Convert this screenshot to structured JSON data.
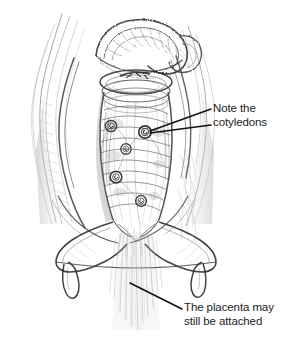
{
  "illustration": {
    "title": "Birth canal with emerging umbilical cord showing cotyledons",
    "medium": "pencil sketch",
    "background_color": "#ffffff",
    "ink_color": "#1c1c1c",
    "pencil_color": "#6e6e70",
    "parts": [
      {
        "name": "cord-loop",
        "description": "looped umbilical cord at top"
      },
      {
        "name": "textured-cord-body",
        "description": "vertical ribbed tubular cord body"
      },
      {
        "name": "cotyledon",
        "description": "small spiral ring structures on cord body",
        "count": 5
      },
      {
        "name": "vulva-flare",
        "description": "flared wing shape with two tapered downward projections"
      },
      {
        "name": "trailing-membranes",
        "description": "fine vertical streaming lines below opening"
      },
      {
        "name": "canal-wall-left",
        "description": "flowing pencil strokes forming left wall"
      },
      {
        "name": "canal-wall-right",
        "description": "flowing pencil strokes forming right wall"
      }
    ]
  },
  "annotations": [
    {
      "id": "cotyledons",
      "line1": "Note the",
      "line2": "cotyledons",
      "leader_count": 2,
      "points_to": "cotyledon"
    },
    {
      "id": "placenta",
      "line1": "The placenta may",
      "line2": "still be attached",
      "leader_count": 1,
      "points_to": "trailing-membranes"
    }
  ]
}
